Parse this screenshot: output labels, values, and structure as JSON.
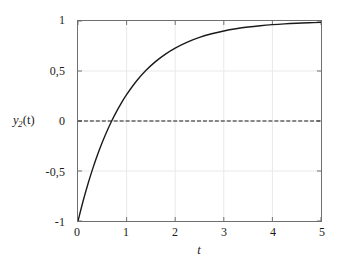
{
  "chart_data": {
    "type": "line",
    "title": "",
    "subtitle": "",
    "xlabel": "t",
    "ylabel": "y2(t)",
    "ylabel_base": "y",
    "ylabel_sub": "2",
    "ylabel_arg": "(t)",
    "xlim": [
      0,
      5
    ],
    "ylim": [
      -1,
      1
    ],
    "grid": true,
    "legend": null,
    "decimal_separator": ",",
    "xticks": [
      0,
      1,
      2,
      3,
      4,
      5
    ],
    "xticklabels": [
      "0",
      "1",
      "2",
      "3",
      "4",
      "5"
    ],
    "yticks": [
      -1,
      -0.5,
      0,
      0.5,
      1
    ],
    "yticklabels": [
      "-1",
      "-0,5",
      "0",
      "0,5",
      "1"
    ],
    "series": [
      {
        "name": "y2(t)",
        "style": "solid",
        "color": "#1a1a1a",
        "width": 1.4,
        "expression": "1 - 2*exp(-t)",
        "x": [
          0,
          0.1,
          0.2,
          0.3,
          0.4,
          0.5,
          0.6,
          0.693,
          0.8,
          0.9,
          1.0,
          1.2,
          1.4,
          1.6,
          1.8,
          2.0,
          2.25,
          2.5,
          2.75,
          3.0,
          3.25,
          3.5,
          3.75,
          4.0,
          4.25,
          4.5,
          4.75,
          5.0
        ],
        "y": [
          -1.0,
          -0.8097,
          -0.6375,
          -0.4816,
          -0.3406,
          -0.2131,
          -0.0976,
          0.0,
          0.1013,
          0.1871,
          0.2642,
          0.3976,
          0.5069,
          0.5963,
          0.6694,
          0.7293,
          0.7892,
          0.8358,
          0.8721,
          0.9004,
          0.9224,
          0.9396,
          0.9529,
          0.9634,
          0.9715,
          0.9778,
          0.9827,
          0.9865
        ],
        "zero_crossing_t": 0.693,
        "start_value": -1.0,
        "asymptote": 1.0
      },
      {
        "name": "zero-reference",
        "style": "dashed",
        "color": "#1a1a1a",
        "width": 1.2,
        "dash_pattern": "4 2",
        "y_constant": 0
      }
    ],
    "colors": {
      "curve": "#1a1a1a",
      "zero_line": "#1a1a1a",
      "grid": "#e9e9e9",
      "frame": "#6f6f6f",
      "background": "#ffffff",
      "text": "#1b1b1b"
    }
  }
}
